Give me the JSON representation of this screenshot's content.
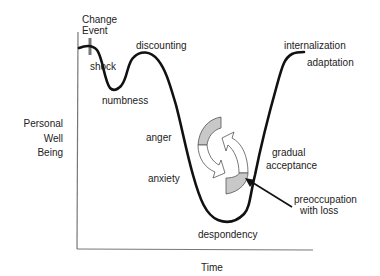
{
  "diagram": {
    "type": "change-curve",
    "axes": {
      "y_label_lines": [
        "Personal",
        "Well",
        "Being"
      ],
      "x_label": "Time"
    },
    "marker": {
      "label_lines": [
        "Change",
        "Event"
      ]
    },
    "stages": {
      "shock": "shock",
      "numbness": "numbness",
      "discounting": "discounting",
      "anger": "anger",
      "anxiety": "anxiety",
      "despondency": "despondency",
      "gradual_acceptance_lines": [
        "gradual",
        "acceptance"
      ],
      "internalization": "internalization",
      "adaptation": "adaptation"
    },
    "callout": {
      "label_lines": [
        "preoccupation",
        "with loss"
      ]
    },
    "colors": {
      "curve": "#111111",
      "axis": "#777777",
      "marker": "#777777",
      "arrow_fill": "#c8c8c8",
      "arrow_outline": "#555555"
    }
  }
}
